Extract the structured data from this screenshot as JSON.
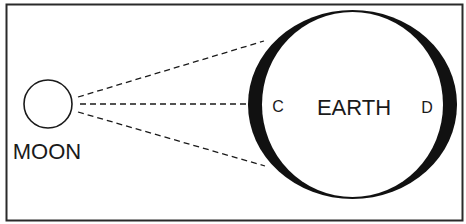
{
  "diagram": {
    "type": "moon-earth-tidal-bulge",
    "labels": {
      "moon": "MOON",
      "earth": "EARTH",
      "point_c": "C",
      "point_d": "D"
    },
    "colors": {
      "line": "#1a1a1a",
      "background": "#ffffff",
      "bulge": "#111111"
    },
    "elements": {
      "moon": {
        "shape": "circle",
        "cx": 48,
        "cy": 104,
        "r": 24
      },
      "earth_outer": {
        "shape": "ellipse",
        "cx": 352.5,
        "cy": 104.5,
        "rx": 104.5,
        "ry": 94.5
      },
      "earth_inner": {
        "shape": "ellipse",
        "cx": 352.5,
        "cy": 104.5,
        "rx": 90.5,
        "ry": 92.5
      },
      "dashed_lines": [
        {
          "from": [
            78,
            97
          ],
          "to": [
            264,
            41
          ]
        },
        {
          "from": [
            80,
            104
          ],
          "to": [
            246,
            104
          ]
        },
        {
          "from": [
            78,
            112
          ],
          "to": [
            265,
            166
          ]
        }
      ]
    }
  }
}
